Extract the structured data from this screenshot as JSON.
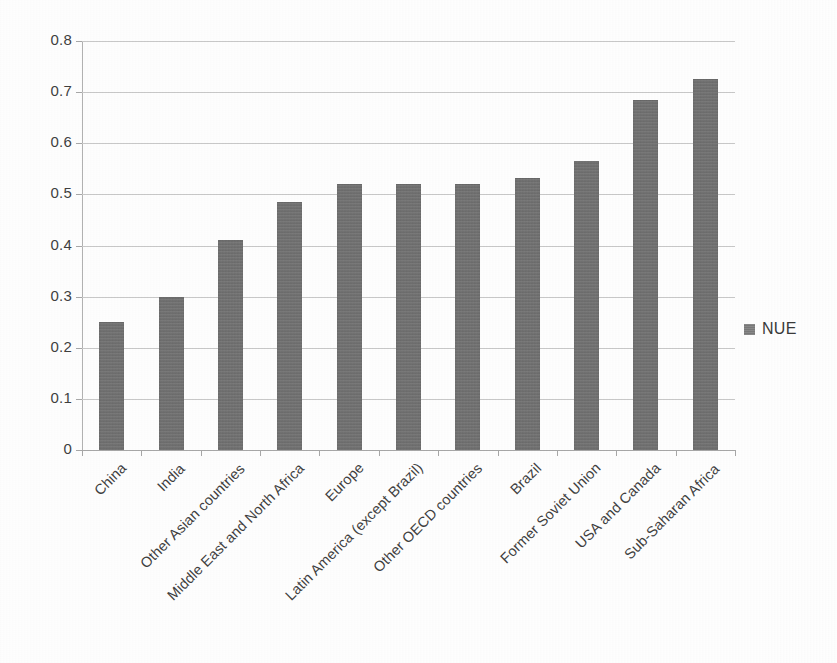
{
  "chart_data": {
    "type": "bar",
    "title": "",
    "subtitle": "",
    "xlabel": "",
    "ylabel": "",
    "categories": [
      "China",
      "India",
      "Other Asian countries",
      "Middle East and North Africa",
      "Europe",
      "Latin America (except Brazil)",
      "Other OECD countries",
      "Brazil",
      "Former Soviet Union",
      "USA and Canada",
      "Sub-Saharan Africa"
    ],
    "series": [
      {
        "name": "NUE",
        "values": [
          0.25,
          0.3,
          0.41,
          0.485,
          0.52,
          0.52,
          0.52,
          0.532,
          0.565,
          0.685,
          0.725
        ],
        "color": "#707070"
      }
    ],
    "ylim": [
      0,
      0.8
    ],
    "ytick_values": [
      0,
      0.1,
      0.2,
      0.3,
      0.4,
      0.5,
      0.6,
      0.7,
      0.8
    ],
    "ytick_labels": [
      "0",
      "0.1",
      "0.2",
      "0.3",
      "0.4",
      "0.5",
      "0.6",
      "0.7",
      "0.8"
    ],
    "grid": true,
    "grid_axis": "y",
    "legend": {
      "position": "right",
      "entries": [
        "NUE"
      ]
    },
    "xtick_rotation": -45
  },
  "legend": {
    "label": "NUE",
    "swatch_color": "#707070"
  },
  "style": {
    "bar_color": "#707070",
    "gridline_color": "#c9c9c9",
    "axis_color": "#a8a8a8",
    "text_color": "#3f3f3f",
    "background": "#ffffff"
  }
}
